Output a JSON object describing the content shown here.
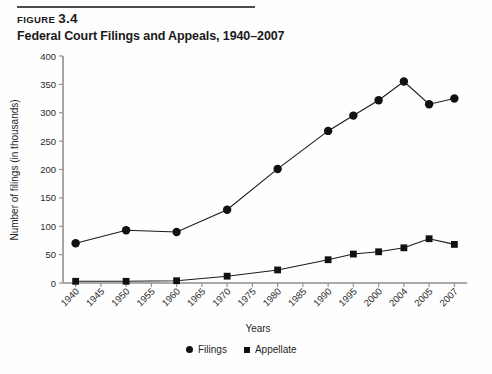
{
  "figure": {
    "label_word": "FIGURE",
    "number": "3.4",
    "title": "Federal Court Filings and Appeals, 1940–2007"
  },
  "legend": {
    "filings_label": "Filings",
    "appellate_label": "Appellate"
  },
  "chart_data": {
    "type": "line",
    "title": "Federal Court Filings and Appeals, 1940–2007",
    "xlabel": "Years",
    "ylabel": "Number of filings (in thousands)",
    "categories": [
      "1940",
      "1945",
      "1950",
      "1955",
      "1960",
      "1965",
      "1970",
      "1975",
      "1980",
      "1985",
      "1990",
      "1995",
      "2000",
      "2004",
      "2005",
      "2007"
    ],
    "xticklabels": [
      "1940",
      "1945",
      "1950",
      "1955",
      "1960",
      "1965",
      "1970",
      "1975",
      "1980",
      "1985",
      "1990",
      "1995",
      "2000",
      "2004",
      "2005",
      "2007"
    ],
    "yticklabels": [
      "0",
      "50",
      "100",
      "150",
      "200",
      "250",
      "300",
      "350",
      "400"
    ],
    "yticks": [
      0,
      50,
      100,
      150,
      200,
      250,
      300,
      350,
      400
    ],
    "ylim": [
      0,
      400
    ],
    "grid": false,
    "legend_position": "bottom-center",
    "series": [
      {
        "name": "Filings",
        "marker": "circle",
        "x": [
          "1940",
          "1950",
          "1960",
          "1970",
          "1980",
          "1990",
          "1995",
          "2000",
          "2004",
          "2005",
          "2007"
        ],
        "values": [
          70,
          93,
          90,
          129,
          201,
          268,
          295,
          322,
          355,
          315,
          325
        ]
      },
      {
        "name": "Appellate",
        "marker": "square",
        "x": [
          "1940",
          "1950",
          "1960",
          "1970",
          "1980",
          "1990",
          "1995",
          "2000",
          "2004",
          "2005",
          "2007"
        ],
        "values": [
          3,
          3,
          4,
          12,
          23,
          41,
          51,
          55,
          62,
          78,
          68
        ]
      }
    ]
  }
}
